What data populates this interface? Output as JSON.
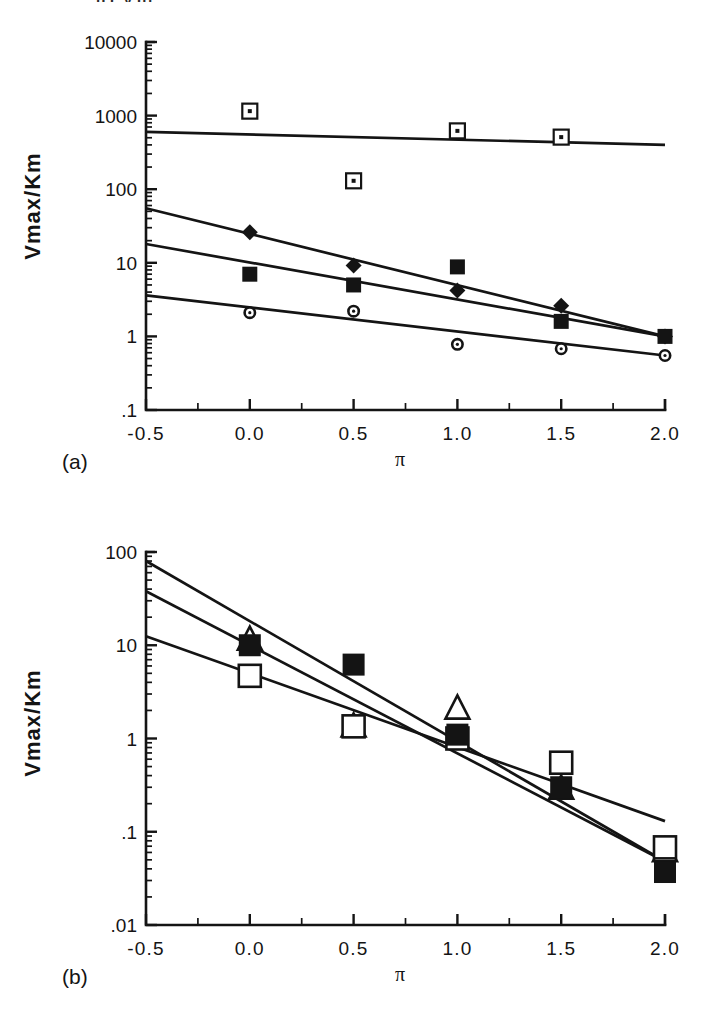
{
  "figure": {
    "clipped_header_text": "p       c        y     g)",
    "panels": [
      {
        "tag": "(a)",
        "xlabel": "π",
        "ylabel": "Vmax/Km"
      },
      {
        "tag": "(b)",
        "xlabel": "π",
        "ylabel": "Vmax/Km"
      }
    ]
  },
  "chart_data": [
    {
      "id": "panel-a",
      "type": "scatter",
      "title": "(a)",
      "xlabel": "π",
      "ylabel": "Vmax/Km",
      "xlim": [
        -0.5,
        2.0
      ],
      "ylim": [
        0.1,
        10000
      ],
      "yscale": "log",
      "xscale": "linear",
      "grid": false,
      "legend": "none",
      "xticks": [
        "-0.5",
        "0.0",
        "0.5",
        "1.0",
        "1.5",
        "2.0"
      ],
      "xtick_values": [
        -0.5,
        0.0,
        0.5,
        1.0,
        1.5,
        2.0
      ],
      "yticks": [
        "10000",
        "1000",
        "100",
        "10",
        "1",
        ".1"
      ],
      "ytick_values": [
        10000,
        1000,
        100,
        10,
        1,
        0.1
      ],
      "series": [
        {
          "name": "open-square-dot",
          "marker": "open-square-with-center-dot",
          "x": [
            0.0,
            0.5,
            1.0,
            1.5
          ],
          "y": [
            1150,
            130,
            620,
            510
          ],
          "fit": {
            "x": [
              -0.5,
              2.0
            ],
            "y": [
              600,
              400
            ]
          }
        },
        {
          "name": "filled-diamond",
          "marker": "filled-diamond",
          "x": [
            0.0,
            0.5,
            1.0,
            1.5,
            2.0
          ],
          "y": [
            26,
            9.2,
            4.2,
            2.6,
            1.0
          ],
          "fit": {
            "x": [
              -0.5,
              2.0
            ],
            "y": [
              55,
              1.0
            ]
          }
        },
        {
          "name": "filled-square",
          "marker": "filled-square",
          "x": [
            0.0,
            0.5,
            1.0,
            1.5,
            2.0
          ],
          "y": [
            7.0,
            5.0,
            8.8,
            1.6,
            1.0
          ],
          "fit": {
            "x": [
              -0.5,
              2.0
            ],
            "y": [
              18,
              1.0
            ]
          }
        },
        {
          "name": "small-open-circle",
          "marker": "small-open-circle",
          "x": [
            0.0,
            0.5,
            1.0,
            1.5,
            2.0
          ],
          "y": [
            2.1,
            2.2,
            0.78,
            0.68,
            0.55
          ],
          "fit": {
            "x": [
              -0.5,
              2.0
            ],
            "y": [
              3.6,
              0.55
            ]
          }
        }
      ]
    },
    {
      "id": "panel-b",
      "type": "scatter",
      "title": "(b)",
      "xlabel": "π",
      "ylabel": "Vmax/Km",
      "xlim": [
        -0.5,
        2.0
      ],
      "ylim": [
        0.01,
        100
      ],
      "yscale": "log",
      "xscale": "linear",
      "grid": false,
      "legend": "none",
      "xticks": [
        "-0.5",
        "0.0",
        "0.5",
        "1.0",
        "1.5",
        "2.0"
      ],
      "xtick_values": [
        -0.5,
        0.0,
        0.5,
        1.0,
        1.5,
        2.0
      ],
      "yticks": [
        "100",
        "10",
        "1",
        ".1",
        ".01"
      ],
      "ytick_values": [
        100,
        10,
        1,
        0.1,
        0.01
      ],
      "series": [
        {
          "name": "open-triangle",
          "marker": "open-triangle",
          "x": [
            0.0,
            0.5,
            1.0,
            1.5,
            2.0
          ],
          "y": [
            11.5,
            1.35,
            2.1,
            0.29,
            0.062
          ],
          "fit": {
            "x": [
              -0.5,
              2.0
            ],
            "y": [
              80,
              0.048
            ]
          }
        },
        {
          "name": "open-square",
          "marker": "open-square",
          "x": [
            0.0,
            0.5,
            1.0,
            1.5,
            2.0
          ],
          "y": [
            4.7,
            1.35,
            1.0,
            0.55,
            0.068
          ],
          "fit": {
            "x": [
              -0.5,
              2.0
            ],
            "y": [
              12.5,
              0.13
            ]
          }
        },
        {
          "name": "filled-square",
          "marker": "filled-square",
          "x": [
            0.0,
            0.5,
            1.0,
            1.5,
            2.0
          ],
          "y": [
            10.0,
            6.2,
            1.1,
            0.3,
            0.037
          ],
          "fit": {
            "x": [
              -0.5,
              2.0
            ],
            "y": [
              38,
              0.048
            ]
          }
        }
      ]
    }
  ]
}
